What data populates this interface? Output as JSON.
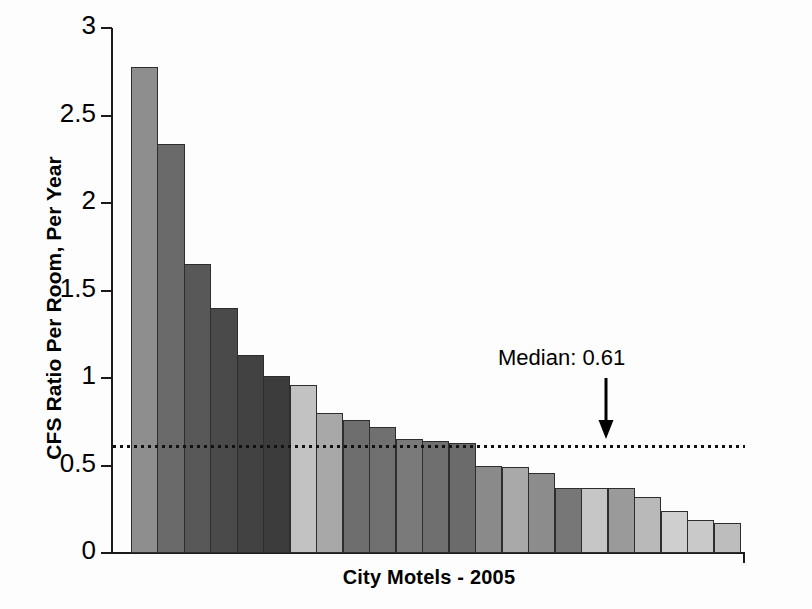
{
  "chart_data": {
    "type": "bar",
    "title": "",
    "xlabel": "City Motels - 2005",
    "ylabel": "CFS Ratio Per Room, Per Year",
    "ylim": [
      0,
      3
    ],
    "yticks": [
      0,
      0.5,
      1,
      1.5,
      2,
      2.5,
      3
    ],
    "ytick_labels": [
      "0",
      "0.5",
      "1",
      "1.5",
      "2",
      "2.5",
      "3"
    ],
    "grid": false,
    "legend": null,
    "categories": [
      "1",
      "2",
      "3",
      "4",
      "5",
      "6",
      "7",
      "8",
      "9",
      "10",
      "11",
      "12",
      "13",
      "14",
      "15",
      "16",
      "17",
      "18",
      "19",
      "20",
      "21",
      "22",
      "23"
    ],
    "values": [
      2.78,
      2.34,
      1.65,
      1.4,
      1.13,
      1.01,
      0.96,
      0.8,
      0.76,
      0.72,
      0.65,
      0.64,
      0.63,
      0.5,
      0.49,
      0.46,
      0.37,
      0.37,
      0.37,
      0.32,
      0.24,
      0.19,
      0.17
    ],
    "bar_colors": [
      "#8e8e8e",
      "#6a6a6a",
      "#585858",
      "#4a4a4a",
      "#424242",
      "#3c3c3c",
      "#c2c2c2",
      "#a8a8a8",
      "#6e6e6e",
      "#707070",
      "#7a7a7a",
      "#6f6f6f",
      "#6b6b6b",
      "#8a8a8a",
      "#a9a9a9",
      "#8c8c8c",
      "#777777",
      "#c6c6c6",
      "#9a9a9a",
      "#b9b9b9",
      "#cfcfcf",
      "#c9c9c9",
      "#bdbdbd"
    ],
    "annotations": [
      {
        "name": "median-annotation",
        "text": "Median: 0.61",
        "value": 0.61,
        "arrow": "down"
      }
    ],
    "reference_line": {
      "name": "median-line",
      "value": 0.61,
      "style": "dotted",
      "color": "#111111"
    }
  }
}
